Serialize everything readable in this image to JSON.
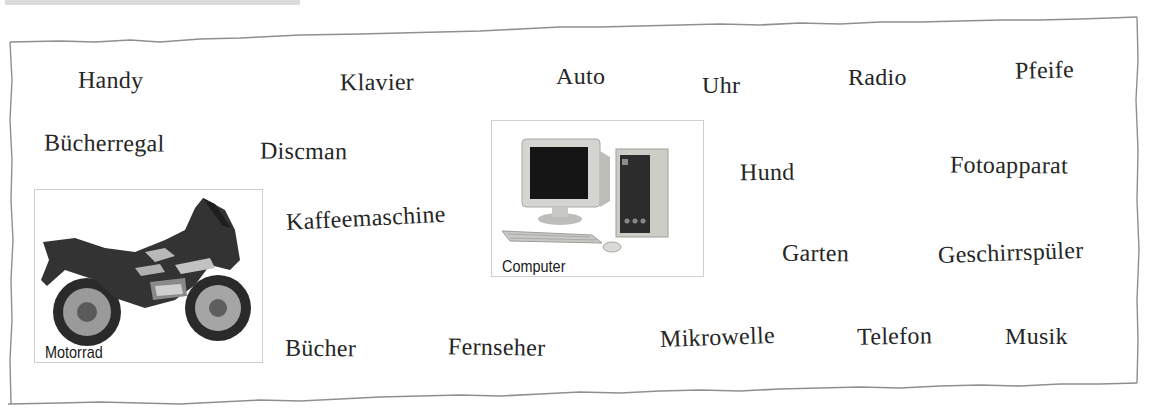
{
  "words": [
    {
      "text": "Handy",
      "x": 78,
      "y": 68,
      "rot": 0.5
    },
    {
      "text": "Klavier",
      "x": 340,
      "y": 70,
      "rot": -0.5
    },
    {
      "text": "Auto",
      "x": 556,
      "y": 64,
      "rot": 0
    },
    {
      "text": "Uhr",
      "x": 702,
      "y": 73,
      "rot": 0
    },
    {
      "text": "Radio",
      "x": 848,
      "y": 65,
      "rot": 0
    },
    {
      "text": "Pfeife",
      "x": 1015,
      "y": 58,
      "rot": -1.5
    },
    {
      "text": "Bücherregal",
      "x": 44,
      "y": 131,
      "rot": 0.5
    },
    {
      "text": "Discman",
      "x": 260,
      "y": 139,
      "rot": 0.5
    },
    {
      "text": "Hund",
      "x": 740,
      "y": 160,
      "rot": -0.5
    },
    {
      "text": "Fotoapparat",
      "x": 950,
      "y": 153,
      "rot": 0.5
    },
    {
      "text": "Kaffeemaschine",
      "x": 286,
      "y": 210,
      "rot": -3
    },
    {
      "text": "Garten",
      "x": 782,
      "y": 241,
      "rot": 0.5
    },
    {
      "text": "Geschirrspüler",
      "x": 938,
      "y": 243,
      "rot": -2
    },
    {
      "text": "Bücher",
      "x": 285,
      "y": 336,
      "rot": 0.5
    },
    {
      "text": "Fernseher",
      "x": 448,
      "y": 335,
      "rot": 1
    },
    {
      "text": "Mikrowelle",
      "x": 660,
      "y": 327,
      "rot": -2
    },
    {
      "text": "Telefon",
      "x": 857,
      "y": 324,
      "rot": -1
    },
    {
      "text": "Musik",
      "x": 1005,
      "y": 324,
      "rot": 0
    }
  ],
  "photos": {
    "motorrad": {
      "label": "Motorrad"
    },
    "computer": {
      "label": "Computer"
    }
  }
}
